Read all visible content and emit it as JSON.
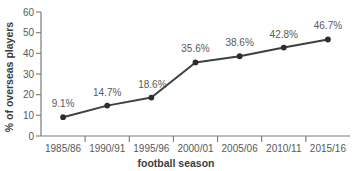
{
  "chart_data": {
    "type": "line",
    "title": "",
    "xlabel": "football season",
    "ylabel": "% of overseas players",
    "categories": [
      "1985/86",
      "1990/91",
      "1995/96",
      "2000/01",
      "2005/06",
      "2010/11",
      "2015/16"
    ],
    "values": [
      9.1,
      14.7,
      18.6,
      35.6,
      38.6,
      42.8,
      46.7
    ],
    "point_labels": [
      "9.1%",
      "14.7%",
      "18.6%",
      "35.6%",
      "38.6%",
      "42.8%",
      "46.7%"
    ],
    "ylim": [
      0,
      60
    ],
    "y_ticks": [
      0,
      10,
      20,
      30,
      40,
      50,
      60
    ],
    "y_tick_labels": [
      "0",
      "10",
      "20",
      "30",
      "40",
      "50",
      "60"
    ],
    "grid": false,
    "legend": false,
    "legend_position": "none",
    "series": [
      {
        "name": "% of overseas players",
        "values": [
          9.1,
          14.7,
          18.6,
          35.6,
          38.6,
          42.8,
          46.7
        ],
        "color": "#3f3f3f",
        "marker": "circle"
      }
    ],
    "colors": {
      "line": "#3f3f3f",
      "marker": "#2e2e2e",
      "axis": "#7a7a7a",
      "tick_text": "#595959",
      "axis_title_text": "#3d3d3d",
      "data_label_text": "#5a5a5a",
      "background": "#ffffff"
    }
  }
}
